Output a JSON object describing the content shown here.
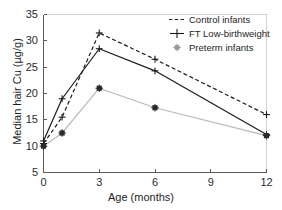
{
  "chart_data": {
    "type": "line",
    "title": "",
    "xlabel": "Age (months)",
    "ylabel": "Median hair Cu (µg/g)",
    "xlim": [
      0,
      12
    ],
    "ylim": [
      5,
      35
    ],
    "xticks": [
      "0",
      "3",
      "6",
      "9",
      "12"
    ],
    "xtick_values": [
      0,
      3,
      6,
      9,
      12
    ],
    "yticks": [
      "5",
      "10",
      "15",
      "20",
      "25",
      "30",
      "35"
    ],
    "ytick_values": [
      5,
      10,
      15,
      20,
      25,
      30,
      35
    ],
    "grid": false,
    "legend_position": "top-right",
    "x": [
      0,
      1,
      3,
      6,
      12
    ],
    "series": [
      {
        "name": "Control infants",
        "values": [
          10.5,
          15.5,
          31.5,
          26.5,
          16.0
        ],
        "color": "#1a1a1a",
        "linestyle": "dashed",
        "marker": "plus"
      },
      {
        "name": "FT Low-birthweight",
        "values": [
          11.0,
          19.0,
          28.5,
          24.3,
          12.2
        ],
        "color": "#1a1a1a",
        "linestyle": "solid",
        "marker": "plus"
      },
      {
        "name": "Preterm infants",
        "values": [
          10.0,
          12.5,
          21.0,
          17.3,
          12.0
        ],
        "color": "#b9b9b9",
        "linestyle": "solid",
        "marker": "asterisk"
      }
    ]
  },
  "legend": {
    "entries": [
      {
        "label": "Control infants"
      },
      {
        "label": "FT Low-birthweight"
      },
      {
        "label": "Preterm infants"
      }
    ]
  },
  "colors": {
    "axis": "#5a5a5a",
    "text": "#1e1e1e",
    "dark_series": "#1a1a1a",
    "light_series": "#b9b9b9",
    "background": "#ffffff"
  }
}
